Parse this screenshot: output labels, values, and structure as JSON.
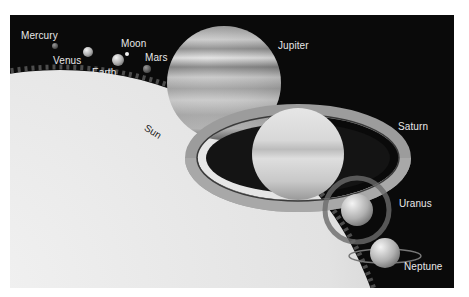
{
  "figure": {
    "background_color": "#0a0a0a",
    "labels": {
      "mercury": "Mercury",
      "venus": "Venus",
      "earth": "Earth",
      "moon": "Moon",
      "mars": "Mars",
      "jupiter": "Jupiter",
      "saturn": "Saturn",
      "sun": "Sun",
      "uranus": "Uranus",
      "neptune": "Neptune"
    },
    "bodies": [
      {
        "name": "Mercury",
        "x": 55,
        "y": 46,
        "r": 3
      },
      {
        "name": "Venus",
        "x": 88,
        "y": 52,
        "r": 5
      },
      {
        "name": "Earth",
        "x": 118,
        "y": 60,
        "r": 6
      },
      {
        "name": "Moon",
        "x": 127,
        "y": 54,
        "r": 2
      },
      {
        "name": "Mars",
        "x": 147,
        "y": 69,
        "r": 4
      },
      {
        "name": "Jupiter",
        "x": 224,
        "y": 83,
        "r": 57
      },
      {
        "name": "Saturn",
        "x": 298,
        "y": 157,
        "r": 46
      },
      {
        "name": "Uranus",
        "x": 357,
        "y": 210,
        "r": 16
      },
      {
        "name": "Neptune",
        "x": 385,
        "y": 253,
        "r": 15
      }
    ]
  }
}
